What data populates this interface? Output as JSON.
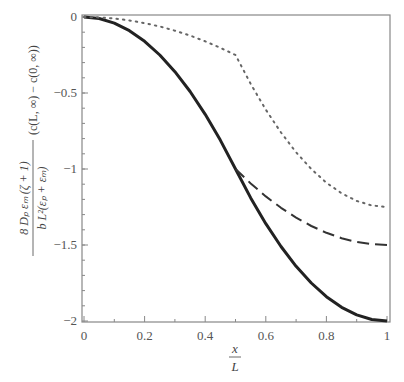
{
  "chart_data": {
    "type": "line",
    "title": "",
    "xlabel": "x/L",
    "ylabel": "8 D_p ε_m (ζ + 1) / (b L² (ε_p + ε_m)) · (c(L, ∞) − c(0, ∞))",
    "ylabel_numerator": "8 Dₚ εₘ (ζ + 1)",
    "ylabel_denominator": "b L²(εₚ + εₘ)",
    "ylabel_suffix": "(c(L, ∞) − c(0, ∞))",
    "xlim": [
      0,
      1
    ],
    "ylim": [
      -2,
      0
    ],
    "x_ticks": [
      "0",
      "0.2",
      "0.4",
      "0.6",
      "0.8",
      "1"
    ],
    "y_ticks": [
      "0",
      "-0.5",
      "-1",
      "-1.5",
      "-2"
    ],
    "grid": false,
    "legend": null,
    "series": [
      {
        "name": "solid",
        "style": "solid",
        "color": "#222222",
        "x": [
          0,
          0.05,
          0.1,
          0.15,
          0.2,
          0.25,
          0.3,
          0.35,
          0.4,
          0.45,
          0.5,
          0.55,
          0.6,
          0.65,
          0.7,
          0.75,
          0.8,
          0.85,
          0.9,
          0.95,
          1.0
        ],
        "y": [
          0,
          -0.01,
          -0.04,
          -0.09,
          -0.16,
          -0.25,
          -0.36,
          -0.49,
          -0.64,
          -0.81,
          -1.0,
          -1.19,
          -1.36,
          -1.51,
          -1.64,
          -1.75,
          -1.84,
          -1.91,
          -1.96,
          -1.99,
          -2.0
        ]
      },
      {
        "name": "dashed",
        "style": "dashed",
        "color": "#333333",
        "x": [
          0.5,
          0.55,
          0.6,
          0.65,
          0.7,
          0.75,
          0.8,
          0.85,
          0.9,
          0.95,
          1.0
        ],
        "y": [
          -1.0,
          -1.095,
          -1.18,
          -1.255,
          -1.32,
          -1.375,
          -1.42,
          -1.455,
          -1.48,
          -1.495,
          -1.5
        ]
      },
      {
        "name": "dotted",
        "style": "dotted",
        "color": "#666666",
        "x": [
          0,
          0.05,
          0.1,
          0.15,
          0.2,
          0.25,
          0.3,
          0.35,
          0.4,
          0.45,
          0.5,
          0.55,
          0.6,
          0.65,
          0.7,
          0.75,
          0.8,
          0.85,
          0.9,
          0.95,
          1.0
        ],
        "y": [
          0,
          -0.0025,
          -0.01,
          -0.0225,
          -0.04,
          -0.0625,
          -0.09,
          -0.1225,
          -0.16,
          -0.2025,
          -0.25,
          -0.44,
          -0.61,
          -0.76,
          -0.89,
          -1.0,
          -1.09,
          -1.16,
          -1.21,
          -1.24,
          -1.25
        ]
      }
    ]
  }
}
